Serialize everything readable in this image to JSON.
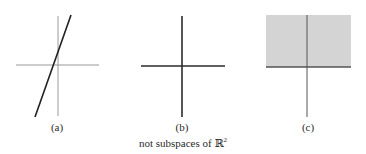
{
  "caption": {
    "text": "not subspaces of ",
    "symbol": "ℝ",
    "exponent": "2"
  },
  "panels": [
    {
      "id": "a",
      "label": "(a)",
      "description": "line not through origin",
      "axes": {
        "h": {
          "x1": 16,
          "x2": 99,
          "y": 65
        },
        "v": {
          "x": 58,
          "y1": 16,
          "y2": 116
        }
      },
      "line": {
        "x1": 71,
        "y1": 15,
        "x2": 35,
        "y2": 117
      }
    },
    {
      "id": "b",
      "label": "(b)",
      "description": "union of two lines through origin",
      "axes": {
        "h": {
          "x1": 141,
          "x2": 225,
          "y": 66
        },
        "v": {
          "x": 182,
          "y1": 16,
          "y2": 117
        }
      }
    },
    {
      "id": "c",
      "label": "(c)",
      "description": "upper half-plane",
      "region": {
        "x": 266,
        "y": 15,
        "width": 85,
        "height": 52
      },
      "axes": {
        "h": {
          "x1": 266,
          "x2": 351,
          "y": 67
        },
        "v": {
          "x": 307,
          "y1": 15,
          "y2": 117
        }
      }
    }
  ],
  "colors": {
    "axis_light": "#9a9a9a",
    "axis_dark": "#2b2b2b",
    "line": "#222222",
    "region_fill": "#d4d4d4",
    "text": "#2a2a2a"
  },
  "label_positions": [
    {
      "x": 57,
      "y": 121
    },
    {
      "x": 182,
      "y": 121
    },
    {
      "x": 308,
      "y": 121
    }
  ]
}
